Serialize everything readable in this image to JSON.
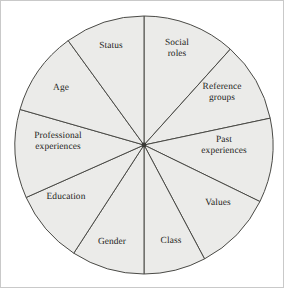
{
  "figure": {
    "background_color": "#ffffff",
    "frame_color": "#c9c9c9"
  },
  "wheel": {
    "center_x": 143,
    "center_y": 144,
    "radius": 129,
    "fill_color": "#ebebe9",
    "stroke_color": "#4a4a46",
    "hub_color": "#3a3a36",
    "sector_count": 10,
    "sectors": [
      {
        "id": "social-roles",
        "label": "Social\nroles",
        "start_angle": -90,
        "end_angle": -48,
        "label_x": 176,
        "label_y": 48
      },
      {
        "id": "reference-groups",
        "label": "Reference\ngroups",
        "start_angle": -48,
        "end_angle": -12,
        "label_x": 221,
        "label_y": 92
      },
      {
        "id": "past-experiences",
        "label": "Past\nexperiences",
        "start_angle": -12,
        "end_angle": 26,
        "label_x": 223,
        "label_y": 145
      },
      {
        "id": "values",
        "label": "Values",
        "start_angle": 26,
        "end_angle": 62,
        "label_x": 217,
        "label_y": 202
      },
      {
        "id": "class",
        "label": "Class",
        "start_angle": 62,
        "end_angle": 90,
        "label_x": 170,
        "label_y": 240
      },
      {
        "id": "gender",
        "label": "Gender",
        "start_angle": 90,
        "end_angle": 123,
        "label_x": 111,
        "label_y": 241
      },
      {
        "id": "education",
        "label": "Education",
        "start_angle": 123,
        "end_angle": 156,
        "label_x": 65,
        "label_y": 196
      },
      {
        "id": "professional-experiences",
        "label": "Professional\nexperiences",
        "start_angle": 156,
        "end_angle": 196,
        "label_x": 57,
        "label_y": 141
      },
      {
        "id": "age",
        "label": "Age",
        "start_angle": 196,
        "end_angle": 234,
        "label_x": 60,
        "label_y": 87
      },
      {
        "id": "status",
        "label": "Status",
        "start_angle": 234,
        "end_angle": 270,
        "label_x": 110,
        "label_y": 45
      }
    ]
  }
}
